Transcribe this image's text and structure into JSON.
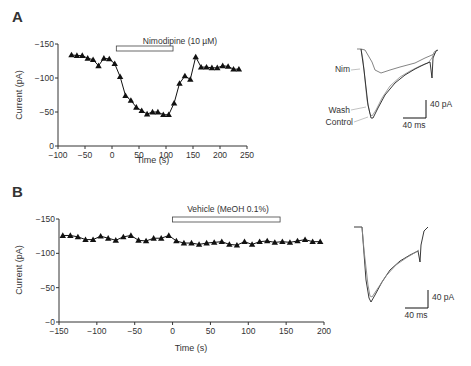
{
  "chart_data": [
    {
      "panel": "A",
      "type": "line",
      "title": "",
      "xlabel": "Time (s)",
      "ylabel": "Current (pA)",
      "xlim": [
        -100,
        250
      ],
      "ylim": [
        0,
        -150
      ],
      "xticks": [
        "-100",
        "-50",
        "0",
        "50",
        "100",
        "150",
        "200",
        "250"
      ],
      "yticks": [
        "0",
        "-50",
        "-100",
        "-150"
      ],
      "annotation": "Nimodipine (10 µM)",
      "bar_range": [
        8,
        113
      ],
      "marker": "triangle",
      "x": [
        -75,
        -65,
        -55,
        -45,
        -35,
        -25,
        -15,
        -5,
        5,
        15,
        25,
        35,
        45,
        55,
        65,
        75,
        85,
        95,
        105,
        115,
        125,
        135,
        145,
        155,
        165,
        175,
        185,
        195,
        205,
        215,
        225,
        235
      ],
      "values": [
        -134,
        -133,
        -133,
        -129,
        -127,
        -118,
        -129,
        -128,
        -121,
        -102,
        -74,
        -67,
        -57,
        -52,
        -47,
        -50,
        -50,
        -46,
        -46,
        -63,
        -92,
        -103,
        -98,
        -131,
        -116,
        -116,
        -115,
        -115,
        -118,
        -117,
        -113,
        -113
      ]
    },
    {
      "panel": "B",
      "type": "line",
      "title": "",
      "xlabel": "Time (s)",
      "ylabel": "Current (pA)",
      "xlim": [
        -150,
        200
      ],
      "ylim": [
        0,
        -150
      ],
      "xticks": [
        "-150",
        "-100",
        "-50",
        "0",
        "50",
        "100",
        "150",
        "200"
      ],
      "yticks": [
        "-0",
        "-50",
        "-100",
        "-150"
      ],
      "annotation": "Vehicle (MeOH 0.1%)",
      "bar_range": [
        0,
        142
      ],
      "marker": "triangle",
      "x": [
        -145,
        -135,
        -125,
        -115,
        -105,
        -95,
        -85,
        -75,
        -65,
        -55,
        -45,
        -35,
        -25,
        -15,
        -5,
        5,
        15,
        25,
        35,
        45,
        55,
        65,
        75,
        85,
        95,
        105,
        115,
        125,
        135,
        145,
        155,
        165,
        175,
        185,
        195
      ],
      "values": [
        -126,
        -126,
        -124,
        -120,
        -120,
        -125,
        -122,
        -119,
        -124,
        -126,
        -119,
        -118,
        -122,
        -122,
        -126,
        -118,
        -115,
        -115,
        -113,
        -115,
        -116,
        -117,
        -113,
        -112,
        -117,
        -113,
        -117,
        -118,
        -116,
        -117,
        -116,
        -118,
        -120,
        -117,
        -117
      ]
    }
  ],
  "panels": {
    "a": {
      "label": "A",
      "ylabel": "Current (pA)",
      "xlabel": "Time (s)",
      "annotation": "Nimodipine (10 µM)",
      "traces": {
        "nim": "Nim",
        "wash": "Wash",
        "control": "Control"
      },
      "scale_y": "40 pA",
      "scale_x": "40 ms"
    },
    "b": {
      "label": "B",
      "ylabel": "Current (pA)",
      "xlabel": "Time (s)",
      "annotation": "Vehicle (MeOH 0.1%)",
      "scale_y": "40 pA",
      "scale_x": "40 ms"
    }
  },
  "colors": {
    "ink": "#111111",
    "axis": "#333333",
    "trace_light": "#888888"
  }
}
